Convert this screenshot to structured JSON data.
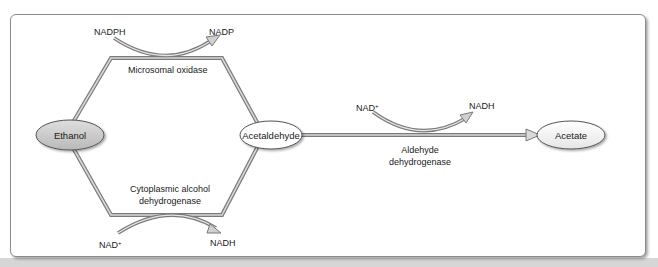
{
  "diagram": {
    "type": "metabolic-pathway",
    "nodes": [
      {
        "id": "ethanol",
        "label": "Ethanol",
        "fill": "#c8c8c8"
      },
      {
        "id": "acetaldehyde",
        "label": "Acetaldehyde",
        "fill": "#ffffff"
      },
      {
        "id": "acetate",
        "label": "Acetate",
        "fill": "#f2f2f2"
      }
    ],
    "pathways": {
      "microsomal": {
        "enzyme": "Microsomal oxidase",
        "cofactor_in": "NADPH",
        "cofactor_out": "NADP"
      },
      "cytoplasmic": {
        "enzyme_line1": "Cytoplasmic alcohol",
        "enzyme_line2": "dehydrogenase",
        "cofactor_in": "NAD",
        "cofactor_in_sup": "+",
        "cofactor_out": "NADH"
      },
      "aldehyde": {
        "enzyme_line1": "Aldehyde",
        "enzyme_line2": "dehydrogenase",
        "cofactor_in": "NAD",
        "cofactor_in_sup": "+",
        "cofactor_out": "NADH"
      }
    },
    "colors": {
      "path_stroke": "#7a7a7a",
      "path_fill": "#d9d9d9",
      "frame_border": "#8a8a8a"
    }
  }
}
